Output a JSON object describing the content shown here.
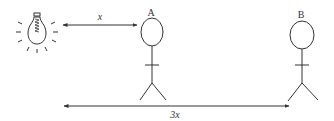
{
  "diagram": {
    "type": "physics-illustration",
    "colors": {
      "stroke": "#333333",
      "background": "#ffffff"
    },
    "light_source": {
      "icon": "light-bulb-icon"
    },
    "persons": [
      {
        "id": "A",
        "label": "A"
      },
      {
        "id": "B",
        "label": "B"
      }
    ],
    "distances": [
      {
        "from": "light_source",
        "to": "A",
        "label": "x"
      },
      {
        "from": "light_source",
        "to": "B",
        "label": "3x"
      }
    ]
  }
}
